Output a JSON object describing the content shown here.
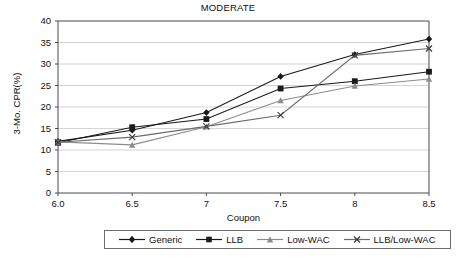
{
  "chart_data": {
    "type": "line",
    "title": "MODERATE",
    "xlabel": "Coupon",
    "ylabel": "3-Mo. CPR(%)",
    "x": [
      6.0,
      6.5,
      7.0,
      7.5,
      8.0,
      8.5
    ],
    "xtick_labels": [
      "6.0",
      "6.5",
      "7",
      "7.5",
      "8",
      "8.5"
    ],
    "ytick_labels": [
      "0",
      "5",
      "10",
      "15",
      "20",
      "25",
      "30",
      "35",
      "40"
    ],
    "ytick_values": [
      0,
      5,
      10,
      15,
      20,
      25,
      30,
      35,
      40
    ],
    "xlim": [
      6.0,
      8.5
    ],
    "ylim": [
      0,
      40
    ],
    "grid": "horizontal",
    "legend_position": "bottom",
    "series": [
      {
        "name": "Generic",
        "marker": "diamond",
        "color": "#1a1a1a",
        "values": [
          12.0,
          14.6,
          18.7,
          27.1,
          32.2,
          35.8
        ]
      },
      {
        "name": "LLB",
        "marker": "square",
        "color": "#1a1a1a",
        "values": [
          11.7,
          15.3,
          17.2,
          24.3,
          26.0,
          28.2
        ]
      },
      {
        "name": "Low-WAC",
        "marker": "triangle",
        "color": "#8c8c8c",
        "values": [
          11.9,
          11.2,
          15.4,
          21.5,
          24.9,
          26.5
        ]
      },
      {
        "name": "LLB/Low-WAC",
        "marker": "cross",
        "color": "#6b6b6b",
        "values": [
          11.8,
          13.0,
          15.5,
          18.1,
          32.0,
          33.6
        ]
      }
    ]
  },
  "legend": {
    "entries": [
      {
        "label": "Generic"
      },
      {
        "label": "LLB"
      },
      {
        "label": "Low-WAC"
      },
      {
        "label": "LLB/Low-WAC"
      }
    ]
  }
}
